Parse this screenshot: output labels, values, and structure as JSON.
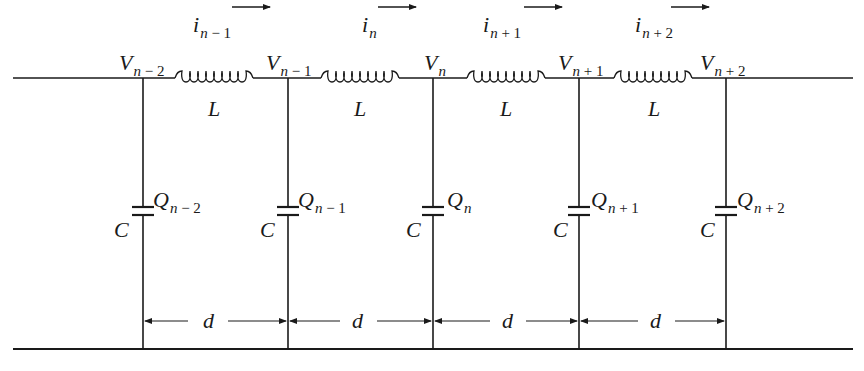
{
  "diagram": {
    "colors": {
      "line": "#1a1a1a",
      "background": "#ffffff"
    },
    "currents": [
      {
        "symbol": "i",
        "subscript_var": "n",
        "subscript_op": "−",
        "subscript_num": "1",
        "arrow": "right-arrow"
      },
      {
        "symbol": "i",
        "subscript_var": "n",
        "subscript_op": "",
        "subscript_num": "",
        "arrow": "right-arrow"
      },
      {
        "symbol": "i",
        "subscript_var": "n",
        "subscript_op": "+",
        "subscript_num": "1",
        "arrow": "right-arrow"
      },
      {
        "symbol": "i",
        "subscript_var": "n",
        "subscript_op": "+",
        "subscript_num": "2",
        "arrow": "right-arrow"
      }
    ],
    "voltages": [
      {
        "symbol": "V",
        "subscript_var": "n",
        "subscript_op": "−",
        "subscript_num": "2"
      },
      {
        "symbol": "V",
        "subscript_var": "n",
        "subscript_op": "−",
        "subscript_num": "1"
      },
      {
        "symbol": "V",
        "subscript_var": "n",
        "subscript_op": "",
        "subscript_num": ""
      },
      {
        "symbol": "V",
        "subscript_var": "n",
        "subscript_op": "+",
        "subscript_num": "1"
      },
      {
        "symbol": "V",
        "subscript_var": "n",
        "subscript_op": "+",
        "subscript_num": "2"
      }
    ],
    "inductors": [
      {
        "label": "L"
      },
      {
        "label": "L"
      },
      {
        "label": "L"
      },
      {
        "label": "L"
      }
    ],
    "charges": [
      {
        "symbol": "Q",
        "subscript_var": "n",
        "subscript_op": "−",
        "subscript_num": "2"
      },
      {
        "symbol": "Q",
        "subscript_var": "n",
        "subscript_op": "−",
        "subscript_num": "1"
      },
      {
        "symbol": "Q",
        "subscript_var": "n",
        "subscript_op": "",
        "subscript_num": ""
      },
      {
        "symbol": "Q",
        "subscript_var": "n",
        "subscript_op": "+",
        "subscript_num": "1"
      },
      {
        "symbol": "Q",
        "subscript_var": "n",
        "subscript_op": "+",
        "subscript_num": "2"
      }
    ],
    "capacitors": [
      {
        "label": "C"
      },
      {
        "label": "C"
      },
      {
        "label": "C"
      },
      {
        "label": "C"
      },
      {
        "label": "C"
      }
    ],
    "spacings": [
      {
        "label": "d"
      },
      {
        "label": "d"
      },
      {
        "label": "d"
      },
      {
        "label": "d"
      }
    ]
  }
}
